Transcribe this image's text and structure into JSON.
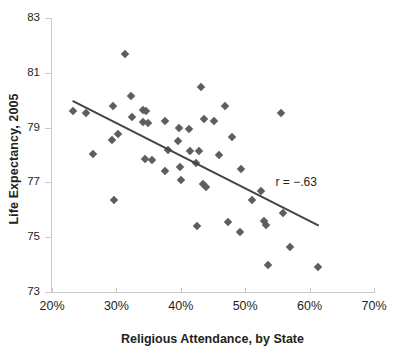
{
  "chart_data": {
    "type": "scatter",
    "title": "",
    "xlabel": "Religious Attendance, by State",
    "ylabel": "Life Expectancy, 2005",
    "xlim": [
      20,
      70
    ],
    "ylim": [
      73,
      83
    ],
    "xticks": [
      "20%",
      "30%",
      "40%",
      "50%",
      "60%",
      "70%"
    ],
    "xtick_values": [
      20,
      30,
      40,
      50,
      60,
      70
    ],
    "yticks": [
      "83",
      "81",
      "79",
      "77",
      "75",
      "73"
    ],
    "ytick_values": [
      83,
      81,
      79,
      77,
      75,
      73
    ],
    "grid": false,
    "legend": "none",
    "annotations": [
      {
        "text": "r = −.63",
        "x": 57.5,
        "y": 77.0
      }
    ],
    "series": [
      {
        "name": "States",
        "marker": "diamond",
        "color": "#5e5e5e",
        "points": [
          [
            23.3,
            79.6
          ],
          [
            25.3,
            79.55
          ],
          [
            26.3,
            78.05
          ],
          [
            29.4,
            79.8
          ],
          [
            29.3,
            78.55
          ],
          [
            29.6,
            76.35
          ],
          [
            30.2,
            78.75
          ],
          [
            31.3,
            81.7
          ],
          [
            32.2,
            80.15
          ],
          [
            32.4,
            79.4
          ],
          [
            34.1,
            79.2
          ],
          [
            34.2,
            79.65
          ],
          [
            34.6,
            79.6
          ],
          [
            34.4,
            77.85
          ],
          [
            34.9,
            79.15
          ],
          [
            35.6,
            77.8
          ],
          [
            37.6,
            79.25
          ],
          [
            37.5,
            77.4
          ],
          [
            38.0,
            78.2
          ],
          [
            39.7,
            79.0
          ],
          [
            39.6,
            78.5
          ],
          [
            39.9,
            77.55
          ],
          [
            40.0,
            77.1
          ],
          [
            41.2,
            78.95
          ],
          [
            41.4,
            78.15
          ],
          [
            42.3,
            77.7
          ],
          [
            42.5,
            75.4
          ],
          [
            42.8,
            78.15
          ],
          [
            43.2,
            80.5
          ],
          [
            43.4,
            76.95
          ],
          [
            43.9,
            76.85
          ],
          [
            43.6,
            79.3
          ],
          [
            45.2,
            79.25
          ],
          [
            45.9,
            78.0
          ],
          [
            46.9,
            79.8
          ],
          [
            47.4,
            75.55
          ],
          [
            48.0,
            78.65
          ],
          [
            49.2,
            75.2
          ],
          [
            49.4,
            77.5
          ],
          [
            51.1,
            76.35
          ],
          [
            52.4,
            76.7
          ],
          [
            52.9,
            75.6
          ],
          [
            53.2,
            75.45
          ],
          [
            53.5,
            74.0
          ],
          [
            55.6,
            79.55
          ],
          [
            55.8,
            75.9
          ],
          [
            56.9,
            74.65
          ],
          [
            61.3,
            73.9
          ]
        ]
      }
    ],
    "trendline": {
      "color": "#444444",
      "x_start": 23.3,
      "y_start": 80.0,
      "x_end": 61.5,
      "y_end": 75.45
    }
  }
}
